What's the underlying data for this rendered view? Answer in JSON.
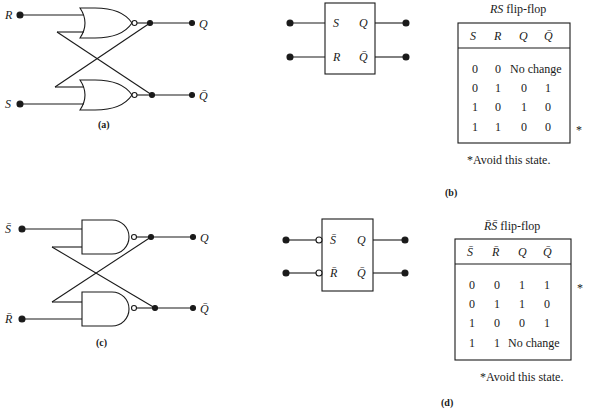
{
  "panel_a": {
    "caption": "(a)",
    "gate_type": "NOR",
    "inputs": [
      "R",
      "S"
    ],
    "outputs": [
      "Q",
      "Q̄"
    ]
  },
  "panel_b": {
    "caption": "(b)",
    "block_inputs": [
      "S",
      "R"
    ],
    "block_outputs": [
      "Q",
      "Q̄"
    ],
    "table_title_italic": "RS",
    "table_title_rest": " flip-flop",
    "headers": [
      "S",
      "R",
      "Q",
      "Q̄"
    ],
    "rows": [
      [
        "0",
        "0",
        "No change",
        ""
      ],
      [
        "0",
        "1",
        "0",
        "1"
      ],
      [
        "1",
        "0",
        "1",
        "0"
      ],
      [
        "1",
        "1",
        "0",
        "0"
      ]
    ],
    "row_marker": "*",
    "footnote": "*Avoid this state."
  },
  "panel_c": {
    "caption": "(c)",
    "gate_type": "NAND",
    "inputs": [
      "S̄",
      "R̄"
    ],
    "outputs": [
      "Q",
      "Q̄"
    ]
  },
  "panel_d": {
    "caption": "(d)",
    "block_inputs": [
      "S̄",
      "R̄"
    ],
    "block_outputs": [
      "Q",
      "Q̄"
    ],
    "table_title_italic": "R̄S̄",
    "table_title_rest": " flip-flop",
    "headers": [
      "S̄",
      "R̄",
      "Q",
      "Q̄"
    ],
    "rows": [
      [
        "0",
        "0",
        "1",
        "1"
      ],
      [
        "0",
        "1",
        "1",
        "0"
      ],
      [
        "1",
        "0",
        "0",
        "1"
      ],
      [
        "1",
        "1",
        "No change",
        ""
      ]
    ],
    "row_marker": "*",
    "footnote": "*Avoid this state."
  }
}
